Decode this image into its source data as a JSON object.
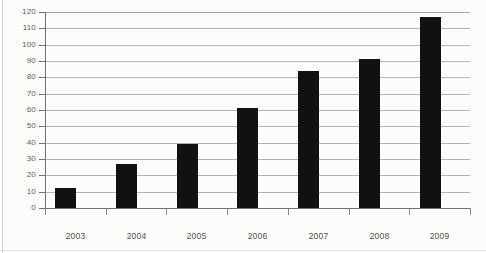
{
  "chart_data": {
    "type": "bar",
    "title": "",
    "subtitle": "",
    "xlabel": "",
    "ylabel": "",
    "categories": [
      "2003",
      "2004",
      "2005",
      "2006",
      "2007",
      "2008",
      "2009"
    ],
    "values": [
      12,
      27,
      39,
      61,
      84,
      91,
      117
    ],
    "series": [
      {
        "name": "",
        "values": [
          12,
          27,
          39,
          61,
          84,
          91,
          117
        ]
      }
    ],
    "ylim": [
      0,
      120
    ],
    "ytick_values": [
      0,
      10,
      20,
      30,
      40,
      50,
      60,
      70,
      80,
      90,
      100,
      110,
      120
    ],
    "ytick_labels": [
      "0",
      "10",
      "20",
      "30",
      "40",
      "50",
      "60",
      "70",
      "80",
      "90",
      "100",
      "110",
      "120"
    ],
    "xtick_labels": [
      "2003",
      "2004",
      "2005",
      "2006",
      "2007",
      "2008",
      "2009"
    ],
    "grid": true,
    "grid_axis": "y",
    "legend": false,
    "legend_position": "none",
    "annotations": [],
    "colors": {
      "bar": "#111111",
      "gridline": "#b2b2b2",
      "axis": "#6f6f6f",
      "tick_label": "#5a5a5a",
      "category_label": "#4f4f4f",
      "background": "#fcfcfb"
    }
  }
}
